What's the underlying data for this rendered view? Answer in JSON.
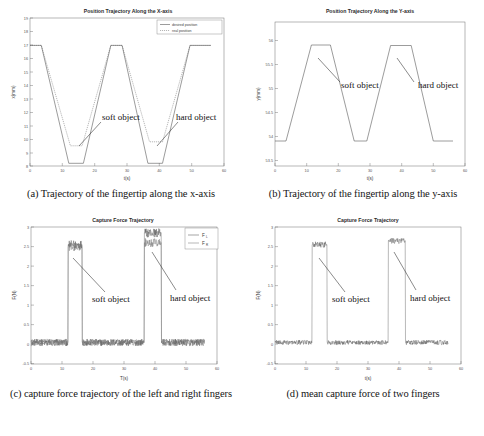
{
  "figure": {
    "panels": [
      {
        "id": "a",
        "caption": "(a) Trajectory of the fingertip along the x-axis",
        "chart_data": {
          "type": "line",
          "title": "Position Trajectory Along the X-axis",
          "xlabel": "t(s)",
          "ylabel": "x(mm)",
          "xlim": [
            0,
            60
          ],
          "ylim": [
            8,
            19
          ],
          "xticks": [
            0,
            10,
            20,
            30,
            40,
            50,
            60
          ],
          "yticks": [
            8,
            9,
            10,
            11,
            12,
            13,
            14,
            15,
            16,
            17,
            18,
            19
          ],
          "grid": false,
          "legend": [
            "desired position",
            "real position"
          ],
          "legend_position": "top-right",
          "annotations": [
            "soft object",
            "hard object"
          ],
          "series": [
            {
              "name": "desired position",
              "style": "solid",
              "x": [
                0,
                3.5,
                12.0,
                16.5,
                25.0,
                28.5,
                36.5,
                41.0,
                49.5,
                53.5,
                56.0
              ],
              "y": [
                17.6,
                17.6,
                8.2,
                8.2,
                17.6,
                17.6,
                8.2,
                8.2,
                17.6,
                17.6,
                17.6
              ]
            },
            {
              "name": "real position",
              "style": "dotted",
              "x": [
                0,
                3.5,
                12.5,
                16.2,
                25.0,
                28.5,
                37.0,
                41.0,
                49.5,
                53.5,
                56.0
              ],
              "y": [
                17.6,
                17.6,
                9.5,
                9.5,
                17.6,
                17.6,
                9.8,
                9.8,
                17.6,
                17.6,
                17.6
              ],
              "note": "clamped on contact with object; soft object plateau 9.5 mm, hard object plateau 9.8 mm"
            }
          ]
        }
      },
      {
        "id": "b",
        "caption": "(b) Trajectory of the fingertip along the y-axis",
        "chart_data": {
          "type": "line",
          "title": "Position Trajectory Along the Y-axis",
          "xlabel": "t(s)",
          "ylabel": "y(mm)",
          "xlim": [
            0,
            60
          ],
          "ylim": [
            53.5,
            56.2
          ],
          "xticks": [
            0,
            10,
            20,
            30,
            40,
            50,
            60
          ],
          "yticks": [
            53.5,
            54,
            54.5,
            55,
            55.5,
            56
          ],
          "grid": false,
          "annotations": [
            "soft object",
            "hard object"
          ],
          "series": [
            {
              "name": "y position",
              "style": "solid",
              "x": [
                0,
                3.5,
                11.5,
                17.5,
                25.0,
                29.0,
                36.5,
                43.0,
                50.0,
                54.0,
                56.0
              ],
              "y": [
                53.9,
                53.9,
                55.9,
                55.9,
                53.9,
                53.9,
                55.88,
                55.88,
                53.9,
                53.9,
                53.9
              ]
            }
          ]
        }
      },
      {
        "id": "c",
        "caption": "(c) capture force trajectory of the left and right fingers",
        "chart_data": {
          "type": "line",
          "title": "Capture Force Trajectory",
          "xlabel": "T(s)",
          "ylabel": "F(N)",
          "xlim": [
            0,
            60
          ],
          "ylim": [
            -0.5,
            3
          ],
          "xticks": [
            0,
            10,
            20,
            30,
            40,
            50,
            60
          ],
          "yticks": [
            -0.5,
            0,
            0.5,
            1,
            1.5,
            2,
            2.5,
            3
          ],
          "grid": false,
          "legend": [
            "F_L",
            "F_R"
          ],
          "legend_position": "top-right",
          "annotations": [
            "soft object",
            "hard object"
          ],
          "series": [
            {
              "name": "F_L",
              "style": "solid-noisy",
              "baseline": 0.05,
              "pulses": [
                {
                  "start": 12.0,
                  "end": 16.5,
                  "level": 2.55,
                  "label": "soft object"
                },
                {
                  "start": 36.5,
                  "end": 42.0,
                  "level": 2.85,
                  "label": "hard object"
                }
              ],
              "noise_amplitude": 0.09
            },
            {
              "name": "F_R",
              "style": "solid-noisy",
              "baseline": 0.05,
              "pulses": [
                {
                  "start": 12.0,
                  "end": 16.5,
                  "level": 2.5,
                  "label": "soft object"
                },
                {
                  "start": 36.5,
                  "end": 42.0,
                  "level": 2.6,
                  "label": "hard object"
                }
              ],
              "noise_amplitude": 0.09
            }
          ]
        }
      },
      {
        "id": "d",
        "caption": "(d) mean capture force of two fingers",
        "chart_data": {
          "type": "line",
          "title": "Capture Force Trajectory",
          "xlabel": "t(s)",
          "ylabel": "F(N)",
          "xlim": [
            0,
            60
          ],
          "ylim": [
            -0.5,
            3
          ],
          "xticks": [
            0,
            10,
            20,
            30,
            40,
            50,
            60
          ],
          "yticks": [
            -0.5,
            0,
            0.5,
            1,
            1.5,
            2,
            2.5,
            3
          ],
          "grid": false,
          "annotations": [
            "soft object",
            "hard object"
          ],
          "series": [
            {
              "name": "mean capture force",
              "style": "solid-noisy",
              "baseline": 0.05,
              "pulses": [
                {
                  "start": 12.0,
                  "end": 16.8,
                  "level": 2.55,
                  "label": "soft object"
                },
                {
                  "start": 36.5,
                  "end": 42.0,
                  "level": 2.65,
                  "label": "hard object"
                }
              ],
              "noise_amplitude": 0.06
            }
          ]
        }
      }
    ]
  },
  "colors": {
    "trace": "#4a4a4a",
    "axis": "#6f6f6f",
    "text": "#1a1a1a",
    "background": "#ffffff"
  }
}
